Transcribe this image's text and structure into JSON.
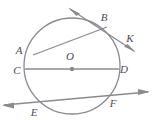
{
  "figure": {
    "type": "geometry-diagram",
    "background_color": "#ffffff",
    "stroke_color": "#8a8a90",
    "label_color": "#4c4c52",
    "canvas": {
      "width": 153,
      "height": 124
    }
  },
  "circle": {
    "name": "circle-O",
    "center": {
      "x": 72,
      "y": 66
    },
    "radius": 48,
    "center_dot_radius": 2.2
  },
  "labels": {
    "A": "A",
    "B": "B",
    "C": "C",
    "D": "D",
    "E": "E",
    "F": "F",
    "K": "K",
    "O": "O"
  },
  "label_positions": {
    "A": {
      "x": 19,
      "y": 54
    },
    "B": {
      "x": 104,
      "y": 21
    },
    "C": {
      "x": 17,
      "y": 74
    },
    "D": {
      "x": 124,
      "y": 73
    },
    "E": {
      "x": 34,
      "y": 116
    },
    "F": {
      "x": 113,
      "y": 107
    },
    "K": {
      "x": 130,
      "y": 42
    },
    "O": {
      "x": 70,
      "y": 60
    }
  },
  "points_on_circle": {
    "A": {
      "x": 33,
      "y": 55
    },
    "B": {
      "x": 106,
      "y": 28
    },
    "C": {
      "x": 25,
      "y": 69
    },
    "D": {
      "x": 119,
      "y": 69
    },
    "E": {
      "x": 41,
      "y": 101
    },
    "F": {
      "x": 110,
      "y": 97
    }
  },
  "lines": [
    {
      "name": "tangent-line-BK",
      "kind": "tangent",
      "through": [
        "B",
        "K"
      ],
      "from": {
        "x": 70,
        "y": 9
      },
      "to": {
        "x": 134,
        "y": 51
      },
      "arrow_start": true,
      "arrow_end": true
    },
    {
      "name": "chord-AB",
      "kind": "chord",
      "through": [
        "A",
        "B"
      ],
      "from": {
        "x": 33,
        "y": 55
      },
      "to": {
        "x": 107,
        "y": 27
      },
      "arrow_start": false,
      "arrow_end": false
    },
    {
      "name": "diameter-CD",
      "kind": "diameter",
      "through": [
        "C",
        "O",
        "D"
      ],
      "from": {
        "x": 25,
        "y": 69
      },
      "to": {
        "x": 119,
        "y": 69
      },
      "arrow_start": false,
      "arrow_end": false
    },
    {
      "name": "secant-line-EF",
      "kind": "secant",
      "through": [
        "E",
        "F"
      ],
      "from": {
        "x": 4,
        "y": 105
      },
      "to": {
        "x": 148,
        "y": 92
      },
      "arrow_start": true,
      "arrow_end": true
    }
  ]
}
